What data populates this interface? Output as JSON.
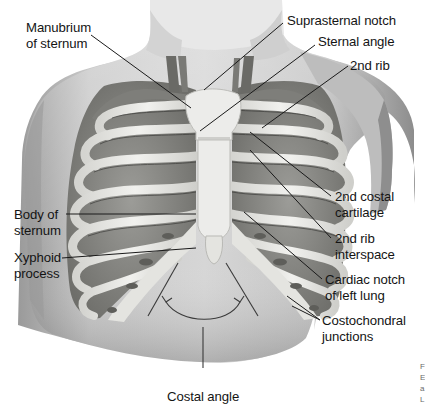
{
  "figure": {
    "labels": {
      "manubrium": [
        "Manubrium",
        "of sternum"
      ],
      "suprasternal_notch": "Suprasternal notch",
      "sternal_angle": "Sternal angle",
      "second_rib": "2nd rib",
      "second_costal_cartilage": [
        "2nd costal",
        "cartilage"
      ],
      "second_rib_interspace": [
        "2nd rib",
        "interspace"
      ],
      "body_of_sternum": [
        "Body of",
        "sternum"
      ],
      "xyphoid_process": [
        "Xyphoid",
        "process"
      ],
      "cardiac_notch": [
        "Cardiac notch",
        "of left lung"
      ],
      "costochondral_junctions": [
        "Costochondral",
        "junctions"
      ],
      "costal_angle": "Costal angle"
    },
    "edge_fragment": [
      "F",
      "E",
      "a",
      "L"
    ]
  },
  "colors": {
    "background": "#ffffff",
    "skin_light": "#d9d9d9",
    "skin_dark": "#8f8f8f",
    "bone": "#e9e9e6",
    "bone_shadow": "#9e9e9a",
    "lung": "#8a8a86",
    "leader_line": "#1a1a1a",
    "text": "#141414"
  }
}
